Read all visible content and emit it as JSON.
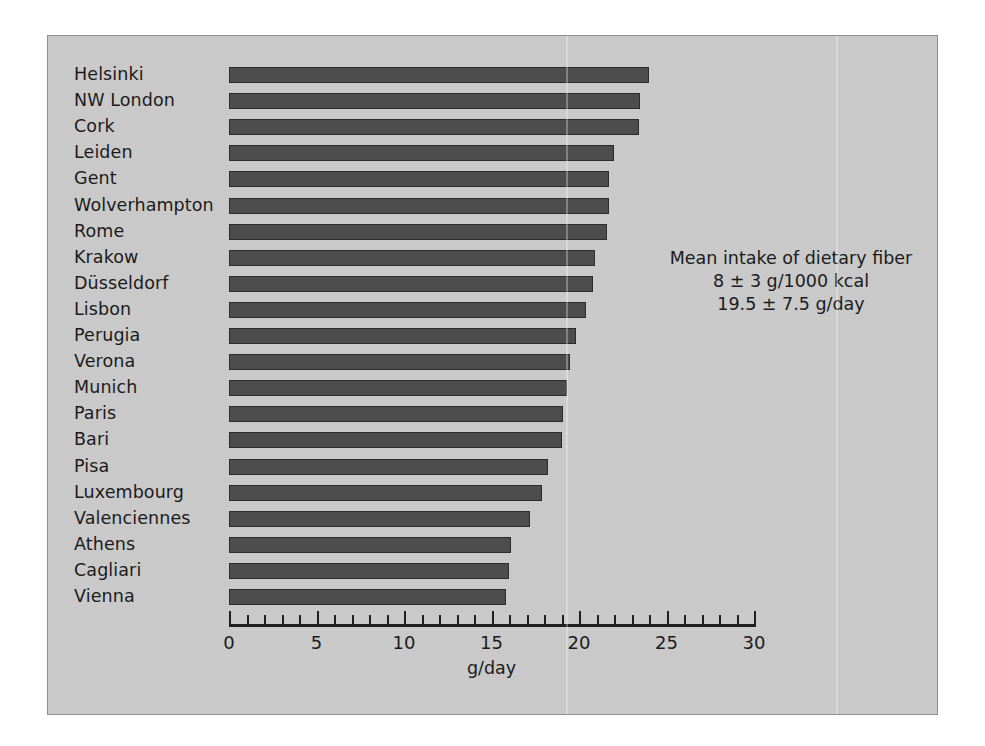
{
  "chart_data": {
    "type": "bar",
    "orientation": "horizontal",
    "title": "",
    "xlabel": "g/day",
    "ylabel": "",
    "xlim": [
      0,
      30
    ],
    "grid": false,
    "legend": null,
    "bar_color": "#4d4d4d",
    "background_color": "#c9c9c9",
    "xticks_major": [
      0,
      5,
      10,
      15,
      20,
      25,
      30
    ],
    "xtick_labels": [
      "0",
      "5",
      "10",
      "15",
      "20",
      "25",
      "30"
    ],
    "xticks_minor_step": 1,
    "categories": [
      "Helsinki",
      "NW London",
      "Cork",
      "Leiden",
      "Gent",
      "Wolverhampton",
      "Rome",
      "Krakow",
      "Düsseldorf",
      "Lisbon",
      "Perugia",
      "Verona",
      "Munich",
      "Paris",
      "Bari",
      "Pisa",
      "Luxembourg",
      "Valenciennes",
      "Athens",
      "Cagliari",
      "Vienna"
    ],
    "values": [
      24.0,
      23.5,
      23.4,
      22.0,
      21.7,
      21.7,
      21.6,
      20.9,
      20.8,
      20.4,
      19.8,
      19.5,
      19.3,
      19.1,
      19.0,
      18.2,
      17.9,
      17.2,
      16.1,
      16.0,
      15.8
    ],
    "annotations": [
      {
        "name": "mean-intake-note",
        "lines": [
          "Mean intake of dietary fiber",
          "8 ± 3 g/1000 kcal",
          "19.5 ± 7.5 g/day"
        ]
      }
    ]
  }
}
